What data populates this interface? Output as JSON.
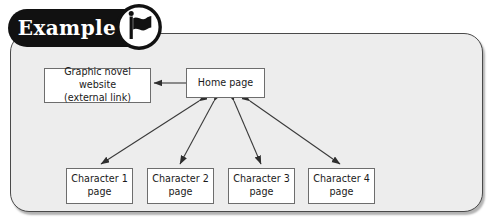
{
  "badge": {
    "label": "Example",
    "icon": "flag-icon"
  },
  "panel": {
    "background_color": "#ededed",
    "border_color": "#4a4a4a"
  },
  "diagram": {
    "type": "site-map",
    "nodes": [
      {
        "id": "external",
        "line1": "Graphic novel website",
        "line2": "(external link)"
      },
      {
        "id": "home",
        "line1": "Home page",
        "line2": ""
      },
      {
        "id": "c1",
        "line1": "Character 1",
        "line2": "page"
      },
      {
        "id": "c2",
        "line1": "Character 2",
        "line2": "page"
      },
      {
        "id": "c3",
        "line1": "Character 3",
        "line2": "page"
      },
      {
        "id": "c4",
        "line1": "Character 4",
        "line2": "page"
      }
    ],
    "connectors": [
      {
        "from": "home",
        "to": "external",
        "arrows": "single"
      },
      {
        "from": "home",
        "to": "c1",
        "arrows": "double"
      },
      {
        "from": "home",
        "to": "c2",
        "arrows": "double"
      },
      {
        "from": "home",
        "to": "c3",
        "arrows": "double"
      },
      {
        "from": "home",
        "to": "c4",
        "arrows": "double"
      }
    ],
    "line_color": "#3a3a3a"
  }
}
